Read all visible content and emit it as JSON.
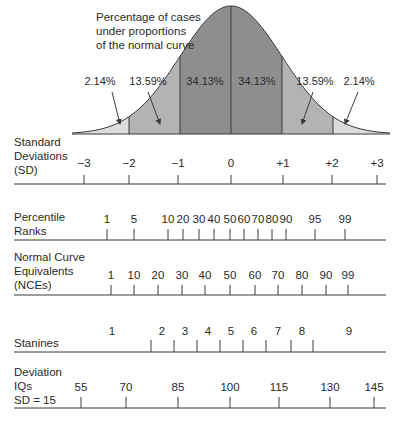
{
  "chart_data": {
    "type": "area",
    "title_lines": [
      "Percentage of cases",
      "under proportions",
      "of the normal curve"
    ],
    "curve": {
      "center_x": 231,
      "sd_px": 51,
      "peak_y": 6,
      "baseline_y": 134,
      "x_start": 72,
      "x_end": 390
    },
    "regions": [
      {
        "name": "lower-tail",
        "from_sd": -3,
        "to_sd": -2,
        "percent": "2.14%",
        "fill": "#dcdcdc"
      },
      {
        "name": "lower-mid",
        "from_sd": -2,
        "to_sd": -1,
        "percent": "13.59%",
        "fill": "#b3b3b3"
      },
      {
        "name": "center-left",
        "from_sd": -1,
        "to_sd": 0,
        "percent": "34.13%",
        "fill": "#8e8e8e"
      },
      {
        "name": "center-right",
        "from_sd": 0,
        "to_sd": 1,
        "percent": "34.13%",
        "fill": "#8e8e8e"
      },
      {
        "name": "upper-mid",
        "from_sd": 1,
        "to_sd": 2,
        "percent": "13.59%",
        "fill": "#b3b3b3"
      },
      {
        "name": "upper-tail",
        "from_sd": 2,
        "to_sd": 3,
        "percent": "2.14%",
        "fill": "#dcdcdc"
      }
    ],
    "percent_labels": [
      {
        "text": "2.14%",
        "x": 100,
        "y": 85,
        "arrow": [
          112,
          92,
          120,
          124
        ]
      },
      {
        "text": "13.59%",
        "x": 148,
        "y": 85,
        "arrow": [
          148,
          92,
          160,
          124
        ]
      },
      {
        "text": "34.13%",
        "x": 205,
        "y": 85
      },
      {
        "text": "34.13%",
        "x": 257,
        "y": 85
      },
      {
        "text": "13.59%",
        "x": 315,
        "y": 85,
        "arrow": [
          313,
          92,
          302,
          124
        ]
      },
      {
        "text": "2.14%",
        "x": 359,
        "y": 85,
        "arrow": [
          358,
          92,
          345,
          124
        ]
      }
    ],
    "scales": [
      {
        "name": "Standard Deviations (SD)",
        "label_lines": [
          "Standard",
          "Deviations",
          "(SD)"
        ],
        "label_y": 146,
        "axis_y": 184,
        "tick_top": 175,
        "value_y": 167,
        "ticks": [
          {
            "label": "−3",
            "x": 84
          },
          {
            "label": "−2",
            "x": 129
          },
          {
            "label": "−1",
            "x": 178
          },
          {
            "label": "0",
            "x": 231
          },
          {
            "label": "+1",
            "x": 283
          },
          {
            "label": "+2",
            "x": 332
          },
          {
            "label": "+3",
            "x": 377
          }
        ]
      },
      {
        "name": "Percentile Ranks",
        "label_lines": [
          "Percentile",
          "Ranks"
        ],
        "label_y": 221,
        "axis_y": 240,
        "tick_top": 229,
        "value_y": 223,
        "ticks": [
          {
            "label": "1",
            "x": 107
          },
          {
            "label": "5",
            "x": 134
          },
          {
            "label": "10",
            "x": 168
          },
          {
            "label": "20",
            "x": 183
          },
          {
            "label": "30",
            "x": 199
          },
          {
            "label": "40",
            "x": 214
          },
          {
            "label": "50",
            "x": 230
          },
          {
            "label": "60",
            "x": 244
          },
          {
            "label": "70",
            "x": 258
          },
          {
            "label": "80",
            "x": 272
          },
          {
            "label": "90",
            "x": 286
          },
          {
            "label": "95",
            "x": 315
          },
          {
            "label": "99",
            "x": 345
          }
        ]
      },
      {
        "name": "Normal Curve Equivalents (NCEs)",
        "label_lines": [
          "Normal Curve",
          "Equivalents",
          "(NCEs)"
        ],
        "label_y": 261,
        "axis_y": 295,
        "tick_top": 285,
        "value_y": 279,
        "ticks": [
          {
            "label": "1",
            "x": 111
          },
          {
            "label": "10",
            "x": 134
          },
          {
            "label": "20",
            "x": 158
          },
          {
            "label": "30",
            "x": 182
          },
          {
            "label": "40",
            "x": 205
          },
          {
            "label": "50",
            "x": 230
          },
          {
            "label": "60",
            "x": 255
          },
          {
            "label": "70",
            "x": 278
          },
          {
            "label": "80",
            "x": 302
          },
          {
            "label": "90",
            "x": 326
          },
          {
            "label": "99",
            "x": 348
          }
        ]
      },
      {
        "name": "Stanines",
        "label_lines": [
          "Stanines"
        ],
        "label_y": 347,
        "axis_y": 352,
        "tick_top": 340,
        "value_y": 335,
        "boundaries": [
          151,
          174,
          197,
          220,
          243,
          266,
          291,
          313
        ],
        "ticks": [
          {
            "label": "1",
            "x": 112
          },
          {
            "label": "2",
            "x": 162
          },
          {
            "label": "3",
            "x": 185
          },
          {
            "label": "4",
            "x": 208
          },
          {
            "label": "5",
            "x": 231
          },
          {
            "label": "6",
            "x": 254
          },
          {
            "label": "7",
            "x": 278
          },
          {
            "label": "8",
            "x": 302
          },
          {
            "label": "9",
            "x": 349
          }
        ]
      },
      {
        "name": "Deviation IQs SD = 15",
        "label_lines": [
          "Deviation",
          "IQs",
          "SD = 15"
        ],
        "label_y": 376,
        "axis_y": 408,
        "tick_top": 397,
        "value_y": 391,
        "ticks": [
          {
            "label": "55",
            "x": 81
          },
          {
            "label": "70",
            "x": 126
          },
          {
            "label": "85",
            "x": 178
          },
          {
            "label": "100",
            "x": 230
          },
          {
            "label": "115",
            "x": 279
          },
          {
            "label": "130",
            "x": 330
          },
          {
            "label": "145",
            "x": 374
          }
        ]
      }
    ],
    "axis_x_start": 14,
    "axis_x_end": 386,
    "stroke_color": "#3a3a3a"
  }
}
